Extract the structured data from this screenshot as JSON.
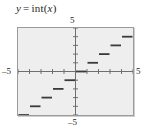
{
  "figure": {
    "caption": {
      "lhs": "y",
      "equals": "=",
      "func": "int",
      "open": "(",
      "arg": "x",
      "close": ")",
      "full": "y = int(x)"
    },
    "axis_labels": {
      "top": "5",
      "bottom": "–5",
      "left": "–5",
      "right": "5"
    },
    "colors": {
      "plot_background": "#eeeeee",
      "frame": "#9a9a9a",
      "axis": "#6f6f6f",
      "curve": "#3a3a3a",
      "text": "#231f20"
    }
  },
  "chart_data": {
    "type": "line",
    "subtitle": "",
    "xlabel": "x",
    "ylabel": "y",
    "xlim": [
      -5,
      5
    ],
    "ylim": [
      -5,
      5
    ],
    "xticks": [
      -5,
      -4,
      -3,
      -2,
      -1,
      0,
      1,
      2,
      3,
      4,
      5
    ],
    "yticks": [
      -5,
      -4,
      -3,
      -2,
      -1,
      0,
      1,
      2,
      3,
      4,
      5
    ],
    "tick_labels_shown": [
      "5",
      "-5",
      "-5",
      "5"
    ],
    "grid": false,
    "legend": null,
    "series": [
      {
        "name": "int(x)",
        "style": "step-floor",
        "segments": [
          {
            "x_start": -5,
            "x_end": -4,
            "y": -5
          },
          {
            "x_start": -4,
            "x_end": -3,
            "y": -4
          },
          {
            "x_start": -3,
            "x_end": -2,
            "y": -3
          },
          {
            "x_start": -2,
            "x_end": -1,
            "y": -2
          },
          {
            "x_start": -1,
            "x_end": 0,
            "y": -1
          },
          {
            "x_start": 0,
            "x_end": 1,
            "y": 0
          },
          {
            "x_start": 1,
            "x_end": 2,
            "y": 1
          },
          {
            "x_start": 2,
            "x_end": 3,
            "y": 2
          },
          {
            "x_start": 3,
            "x_end": 4,
            "y": 3
          },
          {
            "x_start": 4,
            "x_end": 5,
            "y": 4
          }
        ]
      }
    ]
  }
}
